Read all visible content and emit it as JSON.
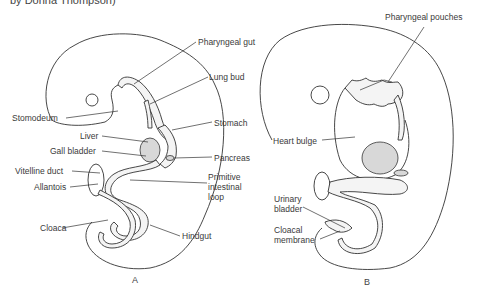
{
  "caption": "by Donna Thompson)",
  "figure_a": {
    "panel_label": "A",
    "labels": {
      "pharyngeal_gut": "Pharyngeal gut",
      "lung_bud": "Lung bud",
      "stomodeum": "Stomodeum",
      "stomach": "Stomach",
      "liver": "Liver",
      "gall_bladder": "Gall bladder",
      "pancreas": "Pancreas",
      "vitelline_duct": "Vitelline duct",
      "allantois": "Allantois",
      "primitive_intestinal_loop_1": "Primitive",
      "primitive_intestinal_loop_2": "intestinal",
      "primitive_intestinal_loop_3": "loop",
      "cloaca": "Cloaca",
      "hindgut": "Hindgut"
    }
  },
  "figure_b": {
    "panel_label": "B",
    "labels": {
      "pharyngeal_pouches": "Pharyngeal pouches",
      "heart_bulge": "Heart bulge",
      "urinary_bladder_1": "Urinary",
      "urinary_bladder_2": "bladder",
      "cloacal_membrane_1": "Cloacal",
      "cloacal_membrane_2": "membrane"
    }
  }
}
